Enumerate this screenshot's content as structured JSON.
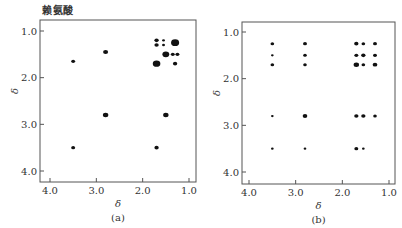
{
  "title": "赖氨酸",
  "chart_data": [
    {
      "type": "scatter",
      "panel_label": "(a)",
      "title": "赖氨酸",
      "xlabel": "δ",
      "ylabel": "δ",
      "xlim": [
        4.2,
        0.85
      ],
      "ylim": [
        4.2,
        0.75
      ],
      "xticks": [
        "4.0",
        "3.0",
        "2.0",
        "1.0"
      ],
      "yticks": [
        "1.0",
        "2.0",
        "3.0",
        "4.0"
      ],
      "grid": false,
      "points": [
        {
          "x": 3.5,
          "y": 1.65,
          "size": 2.2
        },
        {
          "x": 2.8,
          "y": 1.45,
          "size": 2.8
        },
        {
          "x": 1.7,
          "y": 1.2,
          "size": 2.4
        },
        {
          "x": 1.7,
          "y": 1.3,
          "size": 2.4
        },
        {
          "x": 1.55,
          "y": 1.2,
          "size": 1.6
        },
        {
          "x": 1.55,
          "y": 1.3,
          "size": 1.6
        },
        {
          "x": 1.3,
          "y": 1.25,
          "size": 4.5
        },
        {
          "x": 1.5,
          "y": 1.5,
          "size": 3.8
        },
        {
          "x": 1.35,
          "y": 1.5,
          "size": 2.2
        },
        {
          "x": 1.25,
          "y": 1.5,
          "size": 2.2
        },
        {
          "x": 1.7,
          "y": 1.7,
          "size": 4.2
        },
        {
          "x": 1.3,
          "y": 1.7,
          "size": 2.4
        },
        {
          "x": 2.8,
          "y": 2.8,
          "size": 3.0
        },
        {
          "x": 1.5,
          "y": 2.8,
          "size": 3.0
        },
        {
          "x": 3.5,
          "y": 3.5,
          "size": 2.2
        },
        {
          "x": 1.7,
          "y": 3.5,
          "size": 2.4
        }
      ]
    },
    {
      "type": "scatter",
      "panel_label": "(b)",
      "title": "",
      "xlabel": "δ",
      "ylabel": "δ",
      "xlim": [
        4.2,
        0.85
      ],
      "ylim": [
        4.2,
        0.75
      ],
      "xticks": [
        "4.0",
        "3.0",
        "2.0",
        "1.0"
      ],
      "yticks": [
        "1.0",
        "2.0",
        "3.0",
        "4.0"
      ],
      "grid": false,
      "points": [
        {
          "x": 3.5,
          "y": 1.25,
          "size": 2.0
        },
        {
          "x": 3.5,
          "y": 1.5,
          "size": 1.5
        },
        {
          "x": 3.5,
          "y": 1.7,
          "size": 2.0
        },
        {
          "x": 2.8,
          "y": 1.25,
          "size": 2.2
        },
        {
          "x": 2.8,
          "y": 1.5,
          "size": 2.0
        },
        {
          "x": 2.8,
          "y": 1.7,
          "size": 2.0
        },
        {
          "x": 1.7,
          "y": 1.25,
          "size": 2.4
        },
        {
          "x": 1.55,
          "y": 1.25,
          "size": 2.0
        },
        {
          "x": 1.3,
          "y": 1.25,
          "size": 2.2
        },
        {
          "x": 1.7,
          "y": 1.5,
          "size": 2.2
        },
        {
          "x": 1.55,
          "y": 1.5,
          "size": 2.4
        },
        {
          "x": 1.3,
          "y": 1.5,
          "size": 2.2
        },
        {
          "x": 1.7,
          "y": 1.7,
          "size": 3.0
        },
        {
          "x": 1.55,
          "y": 1.7,
          "size": 2.0
        },
        {
          "x": 1.3,
          "y": 1.7,
          "size": 2.6
        },
        {
          "x": 3.5,
          "y": 2.8,
          "size": 1.5
        },
        {
          "x": 2.8,
          "y": 2.8,
          "size": 2.6
        },
        {
          "x": 1.7,
          "y": 2.8,
          "size": 2.4
        },
        {
          "x": 1.55,
          "y": 2.8,
          "size": 2.4
        },
        {
          "x": 1.3,
          "y": 2.8,
          "size": 2.0
        },
        {
          "x": 3.5,
          "y": 3.5,
          "size": 1.5
        },
        {
          "x": 2.8,
          "y": 3.5,
          "size": 1.5
        },
        {
          "x": 1.7,
          "y": 3.5,
          "size": 2.2
        },
        {
          "x": 1.55,
          "y": 3.5,
          "size": 1.5
        }
      ]
    }
  ]
}
